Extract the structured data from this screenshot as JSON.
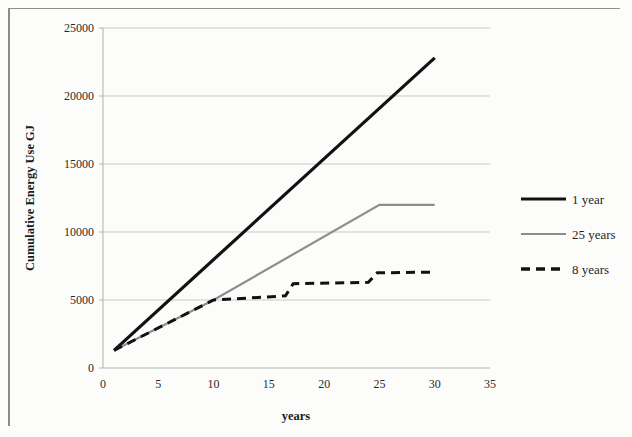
{
  "figure": {
    "background_color": "#fcfcfb",
    "frame_color": "#8a8a8a"
  },
  "chart_data": {
    "type": "line",
    "title": "",
    "subtitle": "",
    "xlabel": "years",
    "ylabel": "Cumulative Energy Use GJ",
    "xlim": [
      0,
      35
    ],
    "ylim": [
      0,
      25000
    ],
    "xticks": [
      0,
      5,
      10,
      15,
      20,
      25,
      30,
      35
    ],
    "yticks": [
      0,
      5000,
      10000,
      15000,
      20000,
      25000
    ],
    "xtick_labels": [
      "0",
      "5",
      "10",
      "15",
      "20",
      "25",
      "30",
      "35"
    ],
    "ytick_labels": [
      "0",
      "5000",
      "10000",
      "15000",
      "20000",
      "25000"
    ],
    "grid": "horizontal",
    "legend_position": "right",
    "series": [
      {
        "name": "1 year",
        "color": "#111111",
        "style": "solid",
        "width": 3.2,
        "points": [
          {
            "x": 1,
            "y": 1300
          },
          {
            "x": 30,
            "y": 22800
          }
        ]
      },
      {
        "name": "25 years",
        "color": "#8d8d8d",
        "style": "solid",
        "width": 2.2,
        "points": [
          {
            "x": 1,
            "y": 1300
          },
          {
            "x": 10,
            "y": 5000
          },
          {
            "x": 25,
            "y": 12000
          },
          {
            "x": 30,
            "y": 12000
          }
        ]
      },
      {
        "name": "8 years",
        "color": "#111111",
        "style": "dashed",
        "width": 3.0,
        "points": [
          {
            "x": 1,
            "y": 1300
          },
          {
            "x": 10,
            "y": 5000
          },
          {
            "x": 16.5,
            "y": 5300
          },
          {
            "x": 17.2,
            "y": 6200
          },
          {
            "x": 24,
            "y": 6300
          },
          {
            "x": 24.8,
            "y": 7000
          },
          {
            "x": 30,
            "y": 7050
          }
        ]
      }
    ],
    "legend_entries": [
      {
        "label": "1 year",
        "color": "#111111",
        "style": "solid"
      },
      {
        "label": "25 years",
        "color": "#8d8d8d",
        "style": "solid"
      },
      {
        "label": "8 years",
        "color": "#111111",
        "style": "dashed"
      }
    ]
  }
}
